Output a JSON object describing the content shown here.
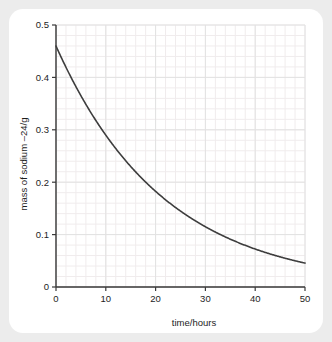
{
  "figure": {
    "background_color": "#ececec",
    "card_color": "#ffffff"
  },
  "chart_data": {
    "type": "line",
    "title": "",
    "subtitle": "",
    "xlabel": "time/hours",
    "ylabel": "mass of sodium –24/g",
    "xlim": [
      0,
      50
    ],
    "ylim": [
      0,
      0.5
    ],
    "xticks": [
      0,
      10,
      20,
      30,
      40,
      50
    ],
    "xticklabels": [
      "0",
      "10",
      "20",
      "30",
      "40",
      "50"
    ],
    "yticks": [
      0,
      0.1,
      0.2,
      0.3,
      0.4,
      0.5
    ],
    "yticklabels": [
      "0",
      "0.1",
      "0.2",
      "0.3",
      "0.4",
      "0.5"
    ],
    "x_minor_step": 2,
    "y_minor_step": 0.02,
    "grid": true,
    "grid_major_color": "#e2e2e2",
    "grid_minor_color": "#f0eced",
    "axis_color": "#3a3a3a",
    "legend": null,
    "legend_position": "none",
    "series": [
      {
        "name": "sodium-24 mass",
        "color": "#3d3d3d",
        "line_width": 1.6,
        "initial_value": 0.46,
        "half_life_hours": 15,
        "x": [
          0,
          2,
          4,
          6,
          8,
          10,
          12,
          14,
          16,
          18,
          20,
          22,
          24,
          26,
          28,
          30,
          32,
          34,
          36,
          38,
          40,
          42,
          44,
          46,
          48,
          50
        ],
        "values": [
          0.46,
          0.419,
          0.382,
          0.348,
          0.317,
          0.289,
          0.263,
          0.24,
          0.219,
          0.199,
          0.182,
          0.165,
          0.151,
          0.137,
          0.125,
          0.114,
          0.104,
          0.095,
          0.086,
          0.079,
          0.072,
          0.065,
          0.059,
          0.054,
          0.049,
          0.045
        ]
      }
    ]
  }
}
